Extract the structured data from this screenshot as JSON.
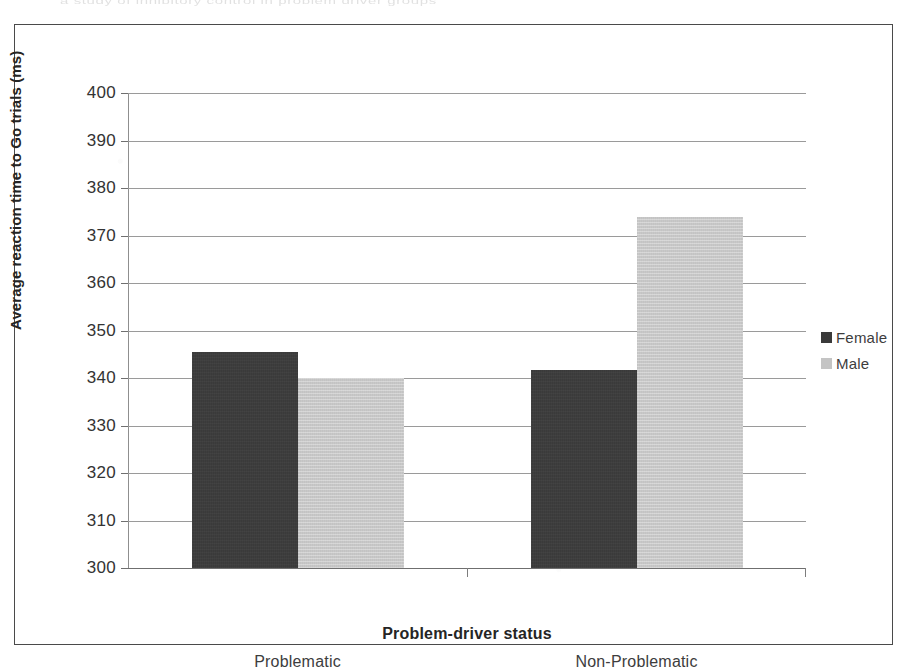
{
  "figure": {
    "bleed_through_text": "a study of inhibitory control in problem driver groups"
  },
  "chart_data": {
    "type": "bar",
    "title": "",
    "categories": [
      "Problematic",
      "Non-Problematic"
    ],
    "series": [
      {
        "name": "Female",
        "color": "#3a3a3a",
        "values": [
          345.5,
          341.7
        ]
      },
      {
        "name": "Male",
        "color": "#c8c8c8",
        "values": [
          340.0,
          374.0
        ]
      }
    ],
    "xlabel": "Problem-driver status",
    "ylabel": "Average reaction time to Go trials (ms)",
    "ylim": [
      300,
      400
    ],
    "ytick_step": 10,
    "yticks": [
      400,
      390,
      380,
      370,
      360,
      350,
      340,
      330,
      320,
      310,
      300
    ],
    "ytick_labels": [
      "400",
      "390",
      "380",
      "370",
      "360",
      "350",
      "340",
      "330",
      "320",
      "310",
      "300"
    ],
    "grid": true,
    "grid_axis": "y",
    "legend": [
      "Female",
      "Male"
    ],
    "legend_position": "right"
  }
}
